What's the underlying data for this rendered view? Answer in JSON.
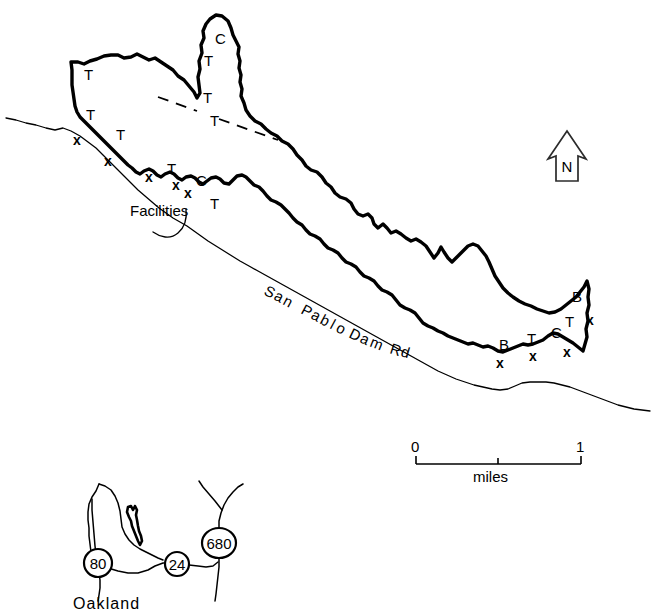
{
  "figure": {
    "background_color": "#ffffff",
    "ink_color": "#000000",
    "width": 651,
    "height": 615
  },
  "main_map": {
    "feature_name": "San Pablo Reservoir",
    "road_label": {
      "text": "San Pablo Dam Rd",
      "characters": [
        "S",
        "a",
        "n",
        "P",
        "a",
        "b",
        "l",
        "o",
        "D",
        "a",
        "m",
        "R",
        "d"
      ]
    },
    "annotation_label": "Facilities",
    "site_codes": [
      {
        "code": "T",
        "x": 84,
        "y": 80,
        "marker": ""
      },
      {
        "code": "T",
        "x": 206,
        "y": 60,
        "marker": ""
      },
      {
        "code": "C",
        "x": 216,
        "y": 42,
        "marker": ""
      },
      {
        "code": "T",
        "x": 86,
        "y": 117,
        "marker": "x"
      },
      {
        "code": "T",
        "x": 116,
        "y": 137,
        "marker": "x"
      },
      {
        "code": "T",
        "x": 168,
        "y": 172,
        "marker": "x"
      },
      {
        "code": "C",
        "x": 198,
        "y": 182,
        "marker": ""
      },
      {
        "code": "T",
        "x": 209,
        "y": 204,
        "marker": "x"
      },
      {
        "code": "B",
        "x": 576,
        "y": 297,
        "marker": ""
      },
      {
        "code": "T",
        "x": 567,
        "y": 322,
        "marker": "x"
      },
      {
        "code": "B",
        "x": 503,
        "y": 346,
        "marker": "x"
      },
      {
        "code": "T",
        "x": 529,
        "y": 340,
        "marker": "x"
      },
      {
        "code": "C",
        "x": 553,
        "y": 335,
        "marker": "x"
      }
    ],
    "dashed_line_labels": [
      "T",
      "T"
    ]
  },
  "north_arrow": {
    "label": "N"
  },
  "scale_bar": {
    "min_label": "0",
    "max_label": "1",
    "units_label": "miles"
  },
  "inset_map": {
    "city_label": "Oakland",
    "highway_shields": [
      {
        "number": "80",
        "shape": "circle",
        "cx": 98,
        "cy": 563
      },
      {
        "number": "24",
        "shape": "circle",
        "cx": 177,
        "cy": 564
      },
      {
        "number": "680",
        "shape": "oval",
        "cx": 219,
        "cy": 543
      }
    ]
  }
}
